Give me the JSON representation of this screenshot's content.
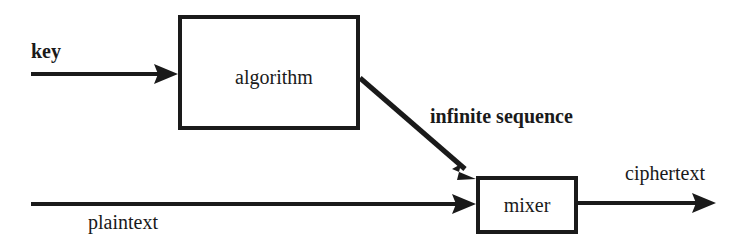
{
  "diagram": {
    "background_color": "#ffffff",
    "ink_color": "#1a1a1a",
    "nodes": [
      {
        "id": "algorithm",
        "label": "algorithm",
        "shape": "rectangle",
        "x": 178,
        "y": 15,
        "width": 182,
        "height": 115,
        "label_x": 274,
        "label_y": 84,
        "stroke_width": 4
      },
      {
        "id": "mixer",
        "label": "mixer",
        "shape": "rectangle",
        "x": 476,
        "y": 176,
        "width": 102,
        "height": 58,
        "label_x": 527,
        "label_y": 212,
        "stroke_width": 4
      }
    ],
    "edges": [
      {
        "id": "key-input",
        "label": "key",
        "label_x": 31,
        "label_y": 58,
        "label_weight": "bold",
        "from_x": 31,
        "from_y": 74,
        "to_x": 178,
        "to_y": 74,
        "kind": "straight-arrow",
        "stroke_width": 4
      },
      {
        "id": "infinite-sequence",
        "label": "infinite sequence",
        "label_x": 430,
        "label_y": 123,
        "label_weight": "bold",
        "from_x": 360,
        "from_y": 78,
        "to_x": 476,
        "to_y": 179,
        "kind": "diagonal-arrow",
        "stroke_width": 5
      },
      {
        "id": "plaintext-input",
        "label": "plaintext",
        "label_x": 88,
        "label_y": 229,
        "label_weight": "normal",
        "from_x": 31,
        "from_y": 204,
        "to_x": 476,
        "to_y": 204,
        "kind": "straight-arrow",
        "stroke_width": 4
      },
      {
        "id": "ciphertext-output",
        "label": "ciphertext",
        "label_x": 625,
        "label_y": 180,
        "label_weight": "normal",
        "from_x": 578,
        "from_y": 203,
        "to_x": 716,
        "to_y": 203,
        "kind": "straight-arrow",
        "stroke_width": 4
      }
    ]
  }
}
